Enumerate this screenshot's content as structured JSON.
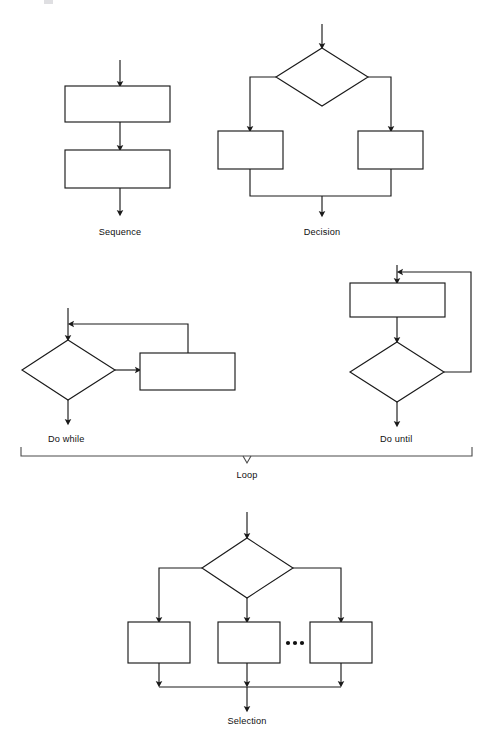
{
  "figure": {
    "background_color": "#ffffff",
    "line_color": "#1a1a1a",
    "bracket_color": "#4a4a4a",
    "text_color": "#101010"
  },
  "constructs": [
    {
      "id": "sequence",
      "label": "Sequence",
      "label_x": 120,
      "label_y": 235,
      "process_boxes": 2,
      "decisions": 0
    },
    {
      "id": "decision",
      "label": "Decision",
      "label_x": 322,
      "label_y": 235,
      "process_boxes": 2,
      "decisions": 1
    },
    {
      "id": "do-while",
      "label": "Do while",
      "label_x": 48,
      "label_y": 442,
      "process_boxes": 1,
      "decisions": 1
    },
    {
      "id": "do-until",
      "label": "Do until",
      "label_x": 380,
      "label_y": 442,
      "process_boxes": 1,
      "decisions": 1
    },
    {
      "id": "loop",
      "label": "Loop",
      "label_x": 247,
      "label_y": 478,
      "process_boxes": 0,
      "decisions": 0
    },
    {
      "id": "selection",
      "label": "Selection",
      "label_x": 247,
      "label_y": 724,
      "process_boxes": 3,
      "decisions": 1
    }
  ],
  "ellipsis": {
    "symbol": "• • •",
    "dot_count": 3,
    "center_x": 295,
    "center_y": 643
  },
  "bracket": {
    "left_x": 21,
    "right_x": 472,
    "y": 456,
    "tick_x": 247,
    "covers": [
      "Do while",
      "Do until"
    ],
    "label": "Loop"
  }
}
